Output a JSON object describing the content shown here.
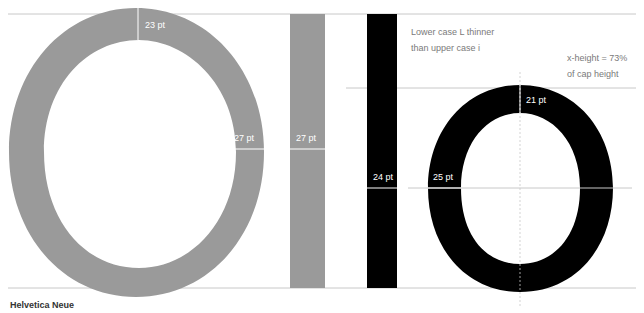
{
  "font_name": "Helvetica Neue",
  "colors": {
    "uppercase_glyph": "#9a9a9a",
    "lowercase_glyph": "#000000",
    "guide_line": "#c8c8c8",
    "label_text": "#ffffff",
    "note_text": "#7a7a7a"
  },
  "glyphs": {
    "upper_O": {
      "char": "O",
      "top_stroke_label": "23 pt",
      "side_stroke_label": "27 pt"
    },
    "upper_I": {
      "char": "I",
      "stem_label": "27 pt"
    },
    "lower_l": {
      "char": "l",
      "stem_label": "24 pt"
    },
    "lower_o": {
      "char": "o",
      "top_stroke_label": "21 pt",
      "side_stroke_label": "25 pt"
    }
  },
  "notes": {
    "l_vs_i": [
      "Lower case L thinner",
      "than upper case i"
    ],
    "x_height": [
      "x-height = 73%",
      "of cap height"
    ]
  },
  "guides": {
    "cap_height": "cap-height",
    "x_height": "x-height",
    "baseline": "baseline"
  }
}
